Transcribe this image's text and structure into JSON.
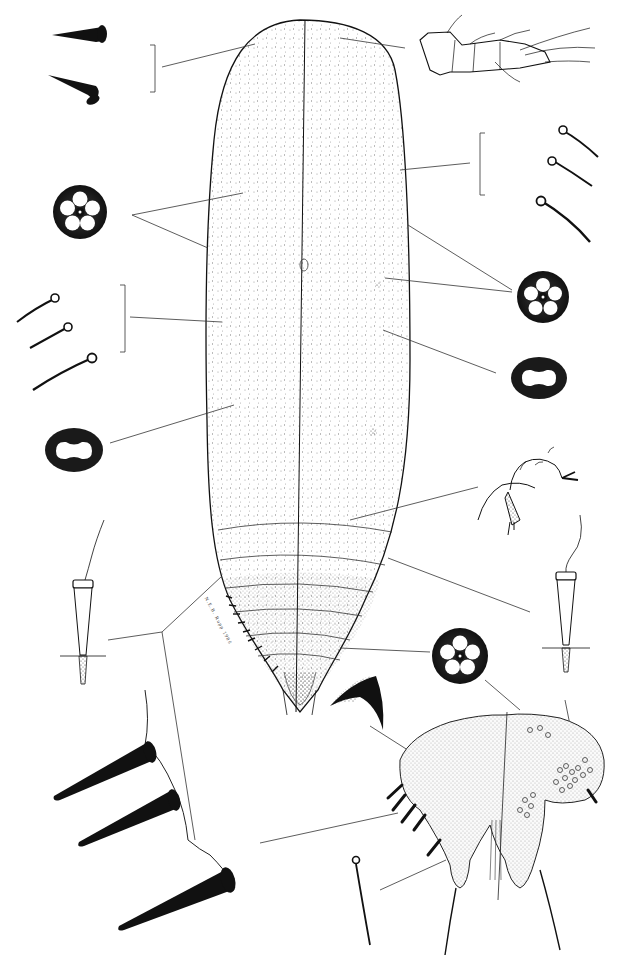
{
  "plate": {
    "subject": "scale insect (Coccoidea) adult female, dorsal/ventral halves",
    "signature": "N.E.B. Rupp 1986",
    "colors": {
      "ink": "#111111",
      "background": "#ffffff",
      "stipple": "#555555"
    }
  },
  "figures": [
    {
      "id": "body-outline",
      "label": "elongate body, dorsal (left) / ventral (right)"
    },
    {
      "id": "dorsal-setae-conical",
      "label": "dorsal conical setae (2)"
    },
    {
      "id": "antenna",
      "label": "antenna"
    },
    {
      "id": "quinquelocular-pore-upper-left",
      "label": "quinquelocular pore"
    },
    {
      "id": "ventral-setae-right",
      "label": "ventral setae (3)"
    },
    {
      "id": "marginal-setae-left",
      "label": "marginal setae (3)"
    },
    {
      "id": "quinquelocular-pore-right",
      "label": "quinquelocular pore"
    },
    {
      "id": "bilocular-pore-left",
      "label": "8-shaped (bilocular) pore"
    },
    {
      "id": "bilocular-pore-right",
      "label": "8-shaped (bilocular) pore"
    },
    {
      "id": "spiracle",
      "label": "spiracle"
    },
    {
      "id": "tubular-duct-left",
      "label": "tubular duct"
    },
    {
      "id": "tubular-duct-right",
      "label": "tubular duct"
    },
    {
      "id": "quinquelocular-pore-lower",
      "label": "quinquelocular pore"
    },
    {
      "id": "anal-ring-seta",
      "label": "curved seta"
    },
    {
      "id": "anal-lobes",
      "label": "anal lobes / pygidium detail"
    },
    {
      "id": "marginal-spines-enlarged",
      "label": "enlarged marginal spines (3)"
    },
    {
      "id": "anal-lobe-seta",
      "label": "apical seta"
    }
  ]
}
